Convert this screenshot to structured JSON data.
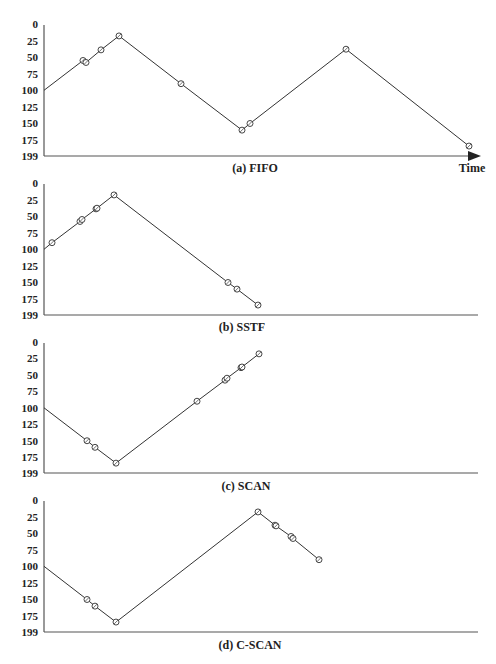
{
  "figure": {
    "y_tick_labels": [
      "0",
      "25",
      "50",
      "75",
      "100",
      "125",
      "150",
      "175",
      "199"
    ],
    "time_label": "Time",
    "colors": {
      "line": "#333333",
      "axis": "#555555",
      "text": "#222222",
      "background": "#ffffff"
    }
  },
  "chart_data": [
    {
      "type": "line",
      "title": "(a) FIFO",
      "xlabel": "Time",
      "ylabel": "Track number",
      "ylim": [
        199,
        0
      ],
      "y_ticks": [
        0,
        25,
        50,
        75,
        100,
        125,
        150,
        175,
        199
      ],
      "start_track": 100,
      "series": [
        {
          "name": "FIFO",
          "values": [
            100,
            55,
            58,
            39,
            18,
            90,
            160,
            150,
            38,
            184
          ]
        }
      ],
      "x": [
        44,
        83,
        86,
        101,
        119,
        181,
        242,
        250,
        346,
        469
      ],
      "grid": false,
      "arrow_axis": true
    },
    {
      "type": "line",
      "title": "(b) SSTF",
      "xlabel": "",
      "ylabel": "Track number",
      "ylim": [
        199,
        0
      ],
      "y_ticks": [
        0,
        25,
        50,
        75,
        100,
        125,
        150,
        175,
        199
      ],
      "start_track": 100,
      "series": [
        {
          "name": "SSTF",
          "values": [
            100,
            90,
            58,
            55,
            39,
            38,
            18,
            150,
            160,
            184
          ]
        }
      ],
      "x": [
        44,
        52,
        80,
        82,
        96,
        97,
        114,
        228,
        237,
        258
      ],
      "grid": false,
      "arrow_axis": false
    },
    {
      "type": "line",
      "title": "(c) SCAN",
      "xlabel": "",
      "ylabel": "Track number",
      "ylim": [
        199,
        0
      ],
      "y_ticks": [
        0,
        25,
        50,
        75,
        100,
        125,
        150,
        175,
        199
      ],
      "start_track": 100,
      "series": [
        {
          "name": "SCAN",
          "values": [
            100,
            150,
            160,
            184,
            90,
            58,
            55,
            39,
            38,
            18
          ]
        }
      ],
      "x": [
        44,
        87,
        95,
        116,
        197,
        225,
        227,
        241,
        242,
        259
      ],
      "grid": false,
      "arrow_axis": false
    },
    {
      "type": "line",
      "title": "(d) C-SCAN",
      "xlabel": "",
      "ylabel": "Track number",
      "ylim": [
        199,
        0
      ],
      "y_ticks": [
        0,
        25,
        50,
        75,
        100,
        125,
        150,
        175,
        199
      ],
      "start_track": 100,
      "series": [
        {
          "name": "C-SCAN",
          "values": [
            100,
            150,
            160,
            184,
            18,
            38,
            39,
            55,
            58,
            90
          ]
        }
      ],
      "x": [
        44,
        87,
        95,
        116,
        258,
        275,
        276,
        291,
        293,
        319
      ],
      "grid": false,
      "arrow_axis": false
    }
  ],
  "layout": {
    "panels": [
      {
        "top": 24,
        "bottom": 156,
        "caption_x": 255,
        "caption_y": 172
      },
      {
        "top": 183,
        "bottom": 315,
        "caption_x": 242,
        "caption_y": 331
      },
      {
        "top": 342,
        "bottom": 473,
        "caption_x": 246,
        "caption_y": 490
      },
      {
        "top": 500,
        "bottom": 632,
        "caption_x": 250,
        "caption_y": 649
      }
    ],
    "axis_x": 44,
    "axis_end": 478,
    "label_right": 38
  }
}
